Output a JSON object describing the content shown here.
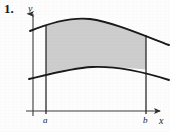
{
  "figure": {
    "exercise_number": "1.",
    "axis_labels": {
      "y": "y",
      "x": "x"
    },
    "tick_labels": {
      "a": "a",
      "b": "b"
    },
    "colors": {
      "shaded_region": "#cdcdcd",
      "curve_stroke": "#1a1a1a",
      "axis_stroke": "#3a3a3a",
      "boundary_line": "#2b2b2b",
      "background": "#fdfdfd",
      "text": "#1a1a1a"
    },
    "geometry": {
      "y_axis_x": 33,
      "x_axis_y": 111,
      "a_x": 46,
      "b_x": 146,
      "upper_curve_path": "M 30 31 C 52 22, 72 17, 90 19 C 112 22, 140 34, 169 45",
      "lower_curve_path": "M 29 79 C 50 74, 72 68, 92 67 C 116 66, 144 72, 169 80",
      "shaded_path": "M 46 26 C 60 21, 74 17.6, 90 19 C 108 20.6, 128 28.4, 146 35.6 L 146 69.6 C 128 67.4, 110 66.6, 92 67 C 74 67.4, 60 70.6, 46 73.2 Z",
      "x_axis_extent": [
        26,
        163
      ],
      "y_axis_extent": [
        12,
        116
      ]
    },
    "chart_data": {
      "type": "area",
      "title": "",
      "xlabel": "x",
      "ylabel": "y",
      "annotations": [
        "a",
        "b"
      ],
      "description": "Region bounded above and below by two curves between the vertical lines x = a and x = b, shaded gray",
      "series": [
        {
          "name": "upper-curve",
          "x": [
            30,
            46,
            60,
            74,
            90,
            108,
            128,
            146,
            169
          ],
          "y": [
            31,
            26,
            21,
            18,
            19,
            21,
            28,
            36,
            45
          ]
        },
        {
          "name": "lower-curve",
          "x": [
            29,
            46,
            60,
            74,
            92,
            110,
            128,
            146,
            169
          ],
          "y": [
            79,
            73,
            71,
            68,
            67,
            67,
            67,
            70,
            80
          ]
        }
      ],
      "vertical_boundaries": [
        {
          "label": "a",
          "x": 46
        },
        {
          "label": "b",
          "x": 146
        }
      ],
      "grid": false,
      "legend": "none"
    }
  }
}
